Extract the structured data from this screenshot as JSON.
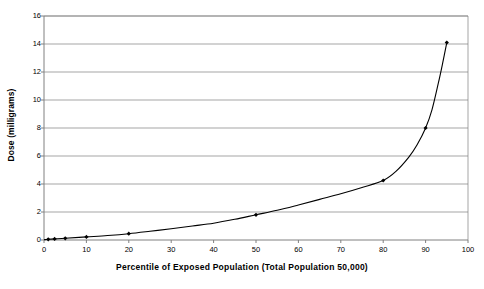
{
  "chart_data": {
    "type": "line",
    "title": "",
    "xlabel": "Percentile of Exposed Population (Total Population 50,000)",
    "ylabel": "Dose (milligrams)",
    "xlim": [
      0,
      100
    ],
    "ylim": [
      0,
      16
    ],
    "xticks": [
      0,
      10,
      20,
      30,
      40,
      50,
      60,
      70,
      80,
      90,
      100
    ],
    "yticks": [
      0,
      2,
      4,
      6,
      8,
      10,
      12,
      14,
      16
    ],
    "grid": "horizontal",
    "legend": "none",
    "marker": "filled-diamond",
    "line_color": "#000000",
    "grid_color": "#808080",
    "axis_color": "#808080",
    "background": "#ffffff",
    "series": [
      {
        "name": "Dose vs Percentile",
        "x": [
          1,
          2.5,
          5,
          10,
          20,
          50,
          80,
          90,
          95
        ],
        "y": [
          0.05,
          0.08,
          0.12,
          0.22,
          0.45,
          1.8,
          4.25,
          8.0,
          14.1
        ]
      }
    ],
    "curve_points": {
      "x": [
        0,
        1,
        2.5,
        5,
        10,
        15,
        20,
        25,
        30,
        35,
        40,
        45,
        50,
        55,
        60,
        65,
        70,
        75,
        80,
        83,
        86,
        88,
        90,
        91.5,
        93,
        94,
        95
      ],
      "y": [
        0.02,
        0.05,
        0.08,
        0.12,
        0.22,
        0.32,
        0.45,
        0.62,
        0.8,
        1.0,
        1.2,
        1.48,
        1.8,
        2.12,
        2.5,
        2.9,
        3.3,
        3.75,
        4.25,
        4.9,
        5.9,
        6.8,
        8.0,
        9.3,
        11.2,
        12.6,
        14.1
      ]
    }
  },
  "axis_labels": {
    "y": [
      "0",
      "2",
      "4",
      "6",
      "8",
      "10",
      "12",
      "14",
      "16"
    ],
    "x": [
      "0",
      "10",
      "20",
      "30",
      "40",
      "50",
      "60",
      "70",
      "80",
      "90",
      "100"
    ]
  }
}
